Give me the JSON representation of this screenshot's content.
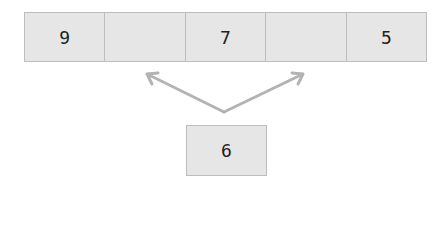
{
  "array": {
    "cells": [
      {
        "value": "9"
      },
      {
        "value": ""
      },
      {
        "value": "7"
      },
      {
        "value": ""
      },
      {
        "value": "5"
      }
    ]
  },
  "element": {
    "value": "6"
  },
  "arrows": {
    "color": "#b3b3b3",
    "origin": [
      224,
      112
    ],
    "targets": [
      [
        147,
        74
      ],
      [
        303,
        74
      ]
    ]
  },
  "colors": {
    "cell_fill": "#e6e6e6",
    "cell_border": "#bdbdbd",
    "text": "#222222"
  }
}
